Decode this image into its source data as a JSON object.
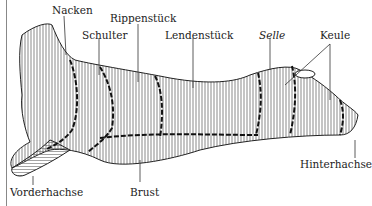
{
  "diagram": {
    "labels": [
      {
        "id": "nacken",
        "text": "Nacken",
        "italic": false
      },
      {
        "id": "rippenstueck",
        "text": "Rippenstück",
        "italic": false
      },
      {
        "id": "schulter",
        "text": "Schulter",
        "italic": false
      },
      {
        "id": "lendenstueck",
        "text": "Lendenstück",
        "italic": false
      },
      {
        "id": "selle",
        "text": "Selle",
        "italic": true
      },
      {
        "id": "keule",
        "text": "Keule",
        "italic": false
      },
      {
        "id": "vorderhachse",
        "text": "Vorderhachse",
        "italic": false
      },
      {
        "id": "brust",
        "text": "Brust",
        "italic": false
      },
      {
        "id": "hinterhachse",
        "text": "Hinterhachse",
        "italic": false
      }
    ],
    "colors": {
      "line": "#222222",
      "hatch": "#555555",
      "background": "#ffffff"
    }
  }
}
